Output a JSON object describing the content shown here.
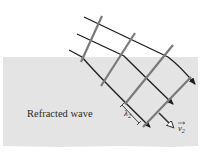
{
  "diagram": {
    "label": "Refracted wave",
    "wavelength_symbol": "λ",
    "wavelength_subscript": "2",
    "velocity_symbol": "v",
    "velocity_subscript": "2",
    "colors": {
      "background": "#ffffff",
      "medium": "#e4e4e4",
      "ray": "#1e1e1e",
      "wavefront": "#7a7a7a",
      "text": "#2a2a2a"
    }
  }
}
